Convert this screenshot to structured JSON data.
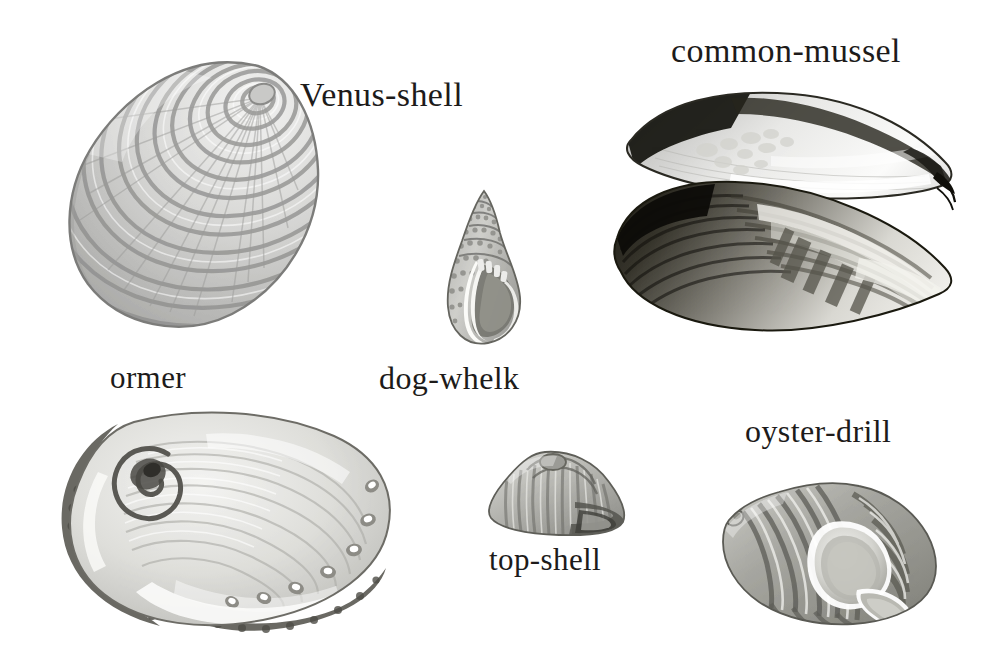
{
  "plate": {
    "background_color": "#ffffff",
    "ink_color": "#1d1b1a",
    "style": "grayscale engraving / halftone natural-history plate",
    "width": 1004,
    "height": 666
  },
  "labels": [
    {
      "id": "venus-shell",
      "text": "Venus-shell",
      "x": 300,
      "y": 76,
      "font_size": 34
    },
    {
      "id": "common-mussel",
      "text": "common-mussel",
      "x": 671,
      "y": 32,
      "font_size": 34
    },
    {
      "id": "ormer",
      "text": "ormer",
      "x": 110,
      "y": 360,
      "font_size": 31
    },
    {
      "id": "dog-whelk",
      "text": "dog-whelk",
      "x": 379,
      "y": 360,
      "font_size": 32
    },
    {
      "id": "top-shell",
      "text": "top-shell",
      "x": 489,
      "y": 542,
      "font_size": 31
    },
    {
      "id": "oyster-drill",
      "text": "oyster-drill",
      "x": 745,
      "y": 413,
      "font_size": 32
    }
  ],
  "figures": [
    {
      "id": "venus-shell",
      "common_name": "Venus-shell",
      "kind": "bivalve",
      "description": "Rounded cockle-like valve with many concentric ridged growth bands radiating from an umbo at the upper right; crenulated scalloped margin.",
      "x": 62,
      "y": 58,
      "width": 262,
      "height": 272,
      "tone": "light grey"
    },
    {
      "id": "common-mussel",
      "common_name": "common-mussel",
      "kind": "bivalve",
      "description": "Two gaping valves; upper valve shows pale pearly interior with dark rim, lower valve shows dark exterior with light banded highlights; hinge at right.",
      "x": 611,
      "y": 88,
      "width": 345,
      "height": 280,
      "tone": "dark with pale nacre"
    },
    {
      "id": "dog-whelk",
      "common_name": "dog-whelk",
      "kind": "gastropod",
      "description": "Small spired sea snail with pointed apex, beaded spiral whorls and an oval aperture with thickened white lip at lower right.",
      "x": 444,
      "y": 189,
      "width": 82,
      "height": 158,
      "tone": "mid grey"
    },
    {
      "id": "ormer",
      "common_name": "ormer",
      "kind": "gastropod",
      "description": "Ear-shaped abalone seen from inside; iridescent pearly interior with spiral at upper left, row of seven respiratory holes along the right margin, dark rough outer rim.",
      "x": 56,
      "y": 404,
      "width": 345,
      "height": 230,
      "tone": "pale pearly with dark rim",
      "respiratory_holes": 7
    },
    {
      "id": "top-shell",
      "common_name": "top-shell",
      "kind": "gastropod",
      "description": "Low conical shell with vertical ribbing and a broad rounded base, viewed from the side.",
      "x": 483,
      "y": 448,
      "width": 150,
      "height": 90,
      "tone": "mid grey"
    },
    {
      "id": "oyster-drill",
      "common_name": "oyster-drill",
      "kind": "gastropod",
      "description": "Strongly ribbed whelk with spire to the left, large pale oval aperture right of centre and a short siphonal canal below.",
      "x": 713,
      "y": 468,
      "width": 232,
      "height": 168,
      "tone": "mid grey with pale aperture"
    }
  ]
}
